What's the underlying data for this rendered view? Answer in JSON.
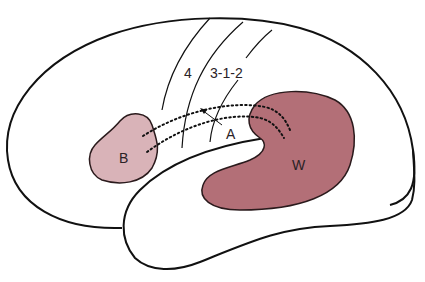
{
  "diagram": {
    "type": "brain-lateral-view",
    "labels": {
      "broca": "B",
      "wernicke": "W",
      "arcuate": "A",
      "motor_area": "4",
      "somatosensory_area": "3-1-2"
    },
    "colors": {
      "outline": "#111111",
      "broca_fill": "#d9b3b8",
      "wernicke_fill": "#b36f77",
      "background": "#ffffff"
    }
  }
}
